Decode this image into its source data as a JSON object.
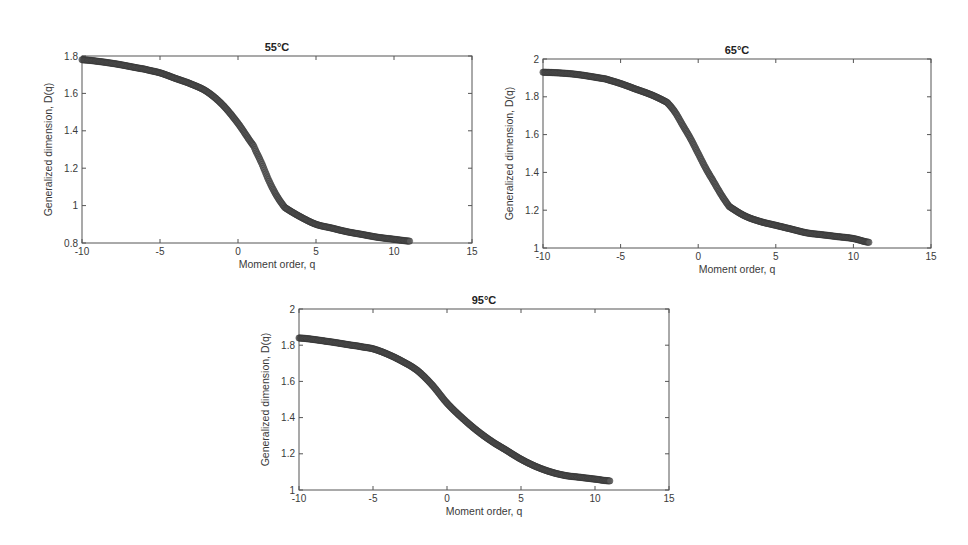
{
  "figure": {
    "panels": [
      {
        "id": "p55",
        "title": "55°C",
        "box": [
          82,
          56,
          472,
          243
        ]
      },
      {
        "id": "p65",
        "title": "65°C",
        "box": [
          543,
          59,
          931,
          248
        ]
      },
      {
        "id": "p95",
        "title": "95°C",
        "box": [
          299,
          309,
          669,
          490
        ]
      }
    ]
  },
  "chart_data": [
    {
      "type": "scatter",
      "title": "55°C",
      "xlabel": "Moment order, q",
      "ylabel": "Generalized dimension, D(q)",
      "xlim": [
        -10,
        15
      ],
      "ylim": [
        0.8,
        1.8
      ],
      "xticks": [
        -10,
        -5,
        0,
        5,
        10,
        15
      ],
      "yticks": [
        0.8,
        1,
        1.2,
        1.4,
        1.6,
        1.8
      ],
      "ytick_labels": [
        "0.8",
        "1",
        "1.2",
        "1.4",
        "1.6",
        "1.8"
      ],
      "grid": false,
      "x": [
        -10,
        -8,
        -6,
        -5,
        -4,
        -3,
        -2,
        -1,
        0,
        1,
        1.5,
        2,
        2.5,
        3,
        4,
        5,
        6,
        7,
        8,
        9,
        10,
        11
      ],
      "y": [
        1.78,
        1.76,
        1.73,
        1.71,
        1.68,
        1.65,
        1.61,
        1.54,
        1.44,
        1.32,
        1.23,
        1.13,
        1.05,
        0.99,
        0.94,
        0.9,
        0.88,
        0.86,
        0.845,
        0.83,
        0.82,
        0.81
      ]
    },
    {
      "type": "scatter",
      "title": "65°C",
      "xlabel": "Moment order, q",
      "ylabel": "Generalized dimension, D(q)",
      "xlim": [
        -10,
        15
      ],
      "ylim": [
        1,
        2
      ],
      "xticks": [
        -10,
        -5,
        0,
        5,
        10,
        15
      ],
      "yticks": [
        1,
        1.2,
        1.4,
        1.6,
        1.8,
        2
      ],
      "ytick_labels": [
        "1",
        "1.2",
        "1.4",
        "1.6",
        "1.8",
        "2"
      ],
      "grid": false,
      "x": [
        -10,
        -8,
        -6,
        -5,
        -4,
        -3,
        -2,
        -1.5,
        -1,
        -0.5,
        0,
        0.5,
        1,
        1.5,
        2,
        3,
        4,
        5,
        6,
        7,
        8,
        9,
        10,
        11
      ],
      "y": [
        1.93,
        1.92,
        1.895,
        1.87,
        1.84,
        1.81,
        1.77,
        1.72,
        1.65,
        1.58,
        1.5,
        1.42,
        1.35,
        1.28,
        1.22,
        1.17,
        1.14,
        1.12,
        1.1,
        1.08,
        1.07,
        1.06,
        1.05,
        1.03
      ]
    },
    {
      "type": "scatter",
      "title": "95°C",
      "xlabel": "Moment order, q",
      "ylabel": "Generalized dimension, D(q)",
      "xlim": [
        -10,
        15
      ],
      "ylim": [
        1,
        2
      ],
      "xticks": [
        -10,
        -5,
        0,
        5,
        10,
        15
      ],
      "yticks": [
        1,
        1.2,
        1.4,
        1.6,
        1.8,
        2
      ],
      "ytick_labels": [
        "1",
        "1.2",
        "1.4",
        "1.6",
        "1.8",
        "2"
      ],
      "grid": false,
      "x": [
        -10,
        -8,
        -6,
        -5,
        -4,
        -3,
        -2,
        -1,
        0,
        1,
        2,
        3,
        4,
        5,
        6,
        7,
        8,
        9,
        10,
        11
      ],
      "y": [
        1.84,
        1.82,
        1.795,
        1.78,
        1.75,
        1.71,
        1.66,
        1.58,
        1.48,
        1.4,
        1.33,
        1.27,
        1.22,
        1.17,
        1.13,
        1.1,
        1.08,
        1.07,
        1.06,
        1.05
      ]
    }
  ]
}
